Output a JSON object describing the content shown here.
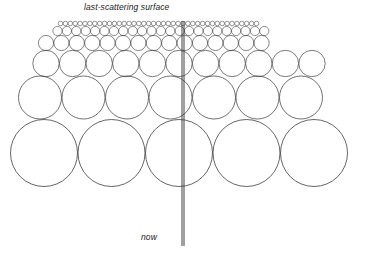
{
  "figure": {
    "type": "cosmological-horizon-diagram",
    "title_label": "last-scattering surface",
    "bottom_label": "now",
    "stroke_color": "#333333",
    "background_color": "#ffffff",
    "worldline": {
      "name": "observer-worldline",
      "x": 183,
      "y_top": 21,
      "y_bottom": 246,
      "style": "double-line",
      "offset_px": 2,
      "color": "#2b2b2b"
    },
    "rows": [
      {
        "index": 0,
        "label": "last-scattering-surface-row",
        "cy": 23.5,
        "r": 2.3,
        "spacing": 4.9,
        "count": 41,
        "x_start": 60.5,
        "stroke": 0.5
      },
      {
        "index": 1,
        "label": "row-2",
        "cy": 31.0,
        "r": 4.6,
        "spacing": 9.4,
        "count": 23,
        "x_start": 57.5,
        "stroke": 0.55
      },
      {
        "index": 2,
        "label": "row-3",
        "cy": 43.0,
        "r": 7.6,
        "spacing": 15.4,
        "count": 15,
        "x_start": 46.0,
        "stroke": 0.6
      },
      {
        "index": 3,
        "label": "row-4",
        "cy": 63.5,
        "r": 13.2,
        "spacing": 26.6,
        "count": 11,
        "x_start": 46.0,
        "stroke": 0.65
      },
      {
        "index": 4,
        "label": "row-5",
        "cy": 97.5,
        "r": 21.5,
        "spacing": 43.5,
        "count": 7,
        "x_start": 40.0,
        "stroke": 0.7
      },
      {
        "index": 5,
        "label": "row-6-now",
        "cy": 153.0,
        "r": 33.5,
        "spacing": 67.5,
        "count": 5,
        "x_start": 44.0,
        "stroke": 0.75
      }
    ],
    "axis_ranges": {
      "width": 377,
      "height": 256
    }
  }
}
